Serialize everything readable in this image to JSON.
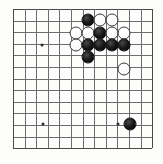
{
  "diagram": {
    "kind": "go-board-diagram",
    "caption_fragment": "",
    "board": {
      "columns": 13,
      "rows": 13,
      "left_px": 13,
      "top_px": 9,
      "spacing_px": 11.6,
      "line_color": "#6d6d6d",
      "edge_color": "#4a4a4a",
      "background_color": "#fdfdfc"
    },
    "star_points": [
      {
        "col": 2.5,
        "row": 3.1,
        "x": 42,
        "y": 45
      },
      {
        "col": 2.6,
        "row": 9.9,
        "x": 43,
        "y": 124
      },
      {
        "col": 9.1,
        "row": 9.9,
        "x": 118,
        "y": 124
      }
    ],
    "stones": [
      {
        "color": "black",
        "x": 88,
        "y": 20,
        "label": "black-stone-1"
      },
      {
        "color": "white",
        "x": 100,
        "y": 20,
        "label": "white-stone-1"
      },
      {
        "color": "white",
        "x": 112,
        "y": 20,
        "label": "white-stone-2"
      },
      {
        "color": "white",
        "x": 76,
        "y": 33,
        "label": "white-stone-3"
      },
      {
        "color": "white",
        "x": 88,
        "y": 33,
        "label": "white-stone-4"
      },
      {
        "color": "black",
        "x": 100,
        "y": 33,
        "label": "black-stone-2"
      },
      {
        "color": "white",
        "x": 112,
        "y": 33,
        "label": "white-stone-5"
      },
      {
        "color": "white",
        "x": 124,
        "y": 33,
        "label": "white-stone-6"
      },
      {
        "color": "white",
        "x": 76,
        "y": 45,
        "label": "white-stone-7"
      },
      {
        "color": "black",
        "x": 88,
        "y": 45,
        "label": "black-stone-3"
      },
      {
        "color": "black",
        "x": 100,
        "y": 45,
        "label": "black-stone-4"
      },
      {
        "color": "black",
        "x": 112,
        "y": 45,
        "label": "black-stone-5"
      },
      {
        "color": "black",
        "x": 124,
        "y": 45,
        "label": "black-stone-6"
      },
      {
        "color": "black",
        "x": 88,
        "y": 57,
        "label": "black-stone-7"
      },
      {
        "color": "white",
        "x": 124,
        "y": 69,
        "label": "white-stone-8"
      },
      {
        "color": "black",
        "x": 130,
        "y": 124,
        "label": "black-stone-8"
      }
    ],
    "stone_diameter_px": 13,
    "colors": {
      "black_stone": "#000000",
      "white_stone": "#ffffff",
      "white_stone_outline": "#3c3c3c",
      "star_point": "#2b2b2b"
    }
  }
}
